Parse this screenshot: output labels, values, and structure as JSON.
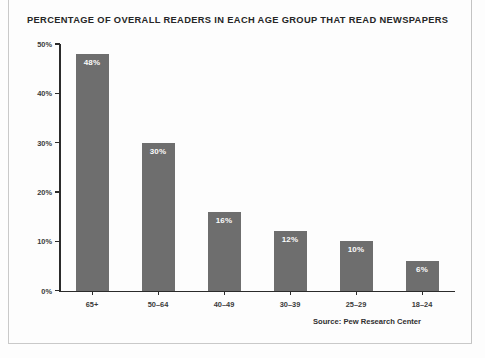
{
  "figure": {
    "title": "PERCENTAGE OF OVERALL READERS IN EACH AGE GROUP THAT READ NEWSPAPERS",
    "source": "Source: Pew Research Center",
    "bar_color": "#6e6e6e",
    "axis_color": "#2b2b2b",
    "background_color": "#fdfdfd",
    "label_color": "#3a3a3a",
    "value_label_color": "#fbfbfb"
  },
  "chart_data": {
    "type": "bar",
    "title": "PERCENTAGE OF OVERALL READERS IN EACH AGE GROUP THAT READ NEWSPAPERS",
    "xlabel": "",
    "ylabel": "",
    "categories": [
      "65+",
      "50–64",
      "40–49",
      "30–39",
      "25–29",
      "18–24"
    ],
    "values": [
      48,
      30,
      16,
      12,
      10,
      6
    ],
    "value_labels": [
      "48%",
      "30%",
      "16%",
      "12%",
      "10%",
      "6%"
    ],
    "ylim": [
      0,
      50
    ],
    "yticks": [
      0,
      10,
      20,
      30,
      40,
      50
    ],
    "ytick_labels": [
      "0%",
      "10%",
      "20%",
      "30%",
      "40%",
      "50%"
    ],
    "grid": false,
    "legend": false,
    "annotations": [
      "Source: Pew Research Center"
    ]
  }
}
